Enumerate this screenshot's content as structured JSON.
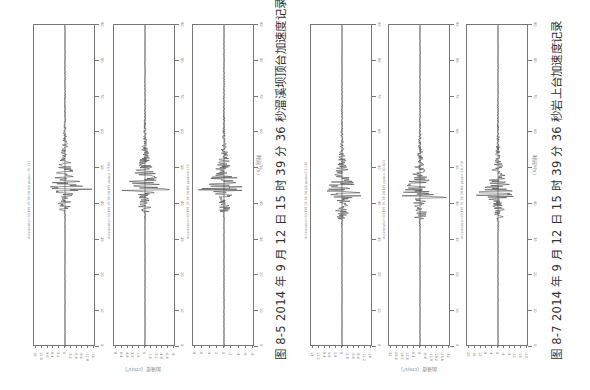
{
  "figures": [
    {
      "id": "fig-8-5",
      "caption": "图 8-5   2014 年 9 月 12 日 15 时 39 分 36 秒溜溪坝顶台加速度记录",
      "time_axis_label": "时间（s）",
      "acc_axis_label": "加速度（cm/s²）",
      "panels": [
        {
          "station_label": "Acceleration 03 EW 15:39:36 UD peak=-15.121",
          "component": "UD",
          "peak": "-15.121"
        },
        {
          "station_label": "Acceleration 03 EW 15:39:36 EW peak=-7.593",
          "component": "EW",
          "peak": "-7.593"
        },
        {
          "station_label": "Acceleration 03 EW 15:39:36 NS peak=6.272",
          "component": "NS",
          "peak": "6.272"
        }
      ]
    },
    {
      "id": "fig-8-7",
      "caption": "图 8-7   2014 年 9 月 12 日 15 时 39 分 36 秒岩上台加速度记录",
      "time_axis_label": "时间（s）",
      "acc_axis_label": "加速度（cm/s²）",
      "panels": [
        {
          "station_label": "Acceleration 03 EW 15:39:36 UD peak=13.130",
          "component": "UD",
          "peak": "13.130"
        },
        {
          "station_label": "Acceleration 03 EW 15:39:36 EW peak=-30.823",
          "component": "EW",
          "peak": "-30.823"
        },
        {
          "station_label": "Acceleration 03 EW 15:39:36 NS peak=-18.710",
          "component": "NS",
          "peak": "-18.710"
        }
      ]
    }
  ],
  "chart_data": [
    {
      "type": "line",
      "title": "图 8-5 2014 年 9 月 12 日 15 时 39 分 36 秒溜溪坝顶台加速度记录",
      "xlabel": "时间（s）",
      "ylabel": "加速度（cm/s²）",
      "orientation": "rotated 90° (time runs bottom-to-top along panel)",
      "time_ticks": [
        0,
        10,
        20,
        30,
        40,
        50,
        60,
        70,
        80,
        90
      ],
      "series": [
        {
          "name": "UD",
          "peak": -15.121,
          "peak_time_s": 44,
          "amp_ticks": [
            -16,
            -12.8,
            -9.6,
            -6.4,
            -3.2,
            0,
            3.2,
            6.4,
            9.6,
            12.8,
            16
          ]
        },
        {
          "name": "EW",
          "peak": -7.593,
          "peak_time_s": 44,
          "amp_ticks": [
            -8,
            -6.4,
            -4.8,
            -3.2,
            -1.6,
            0,
            1.6,
            3.2,
            4.8,
            6.4,
            8
          ]
        },
        {
          "name": "NS",
          "peak": 6.272,
          "peak_time_s": 44,
          "amp_ticks": [
            -8,
            -6,
            -4,
            -2,
            0,
            2,
            4,
            6,
            8
          ]
        }
      ],
      "grid": false
    },
    {
      "type": "line",
      "title": "图 8-7 2014 年 9 月 12 日 15 时 39 分 36 秒岩上台加速度记录",
      "xlabel": "时间（s）",
      "ylabel": "加速度（cm/s²）",
      "orientation": "rotated 90° (time runs bottom-to-top along panel)",
      "time_ticks": [
        0,
        10,
        20,
        30,
        40,
        50,
        60,
        70,
        80,
        90
      ],
      "series": [
        {
          "name": "UD",
          "peak": 13.13,
          "peak_time_s": 42,
          "amp_ticks": [
            -14,
            -11.2,
            -8.4,
            -5.6,
            -2.8,
            0,
            2.8,
            5.6,
            8.4,
            11.2,
            14
          ]
        },
        {
          "name": "EW",
          "peak": -30.823,
          "peak_time_s": 42,
          "amp_ticks": [
            -32,
            -25.6,
            -19.2,
            -12.8,
            -6.4,
            0,
            6.4,
            12.8,
            19.2,
            25.6,
            32
          ]
        },
        {
          "name": "NS",
          "peak": -18.71,
          "peak_time_s": 42,
          "amp_ticks": [
            -20,
            -16,
            -12,
            -8,
            -4,
            0,
            4,
            8,
            12,
            16,
            20
          ]
        }
      ],
      "grid": false
    }
  ]
}
